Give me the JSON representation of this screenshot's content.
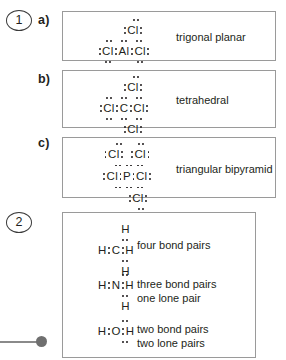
{
  "page": {
    "decoration": "page-marker-dot"
  },
  "questions": [
    {
      "number": "1",
      "parts": [
        {
          "label": "a)",
          "molecule": "AlCl3",
          "center_atom": "Al",
          "outer_atom": "Cl",
          "shape": "trigonal planar"
        },
        {
          "label": "b)",
          "molecule": "CCl4",
          "center_atom": "C",
          "outer_atom": "Cl",
          "shape": "tetrahedral"
        },
        {
          "label": "c)",
          "molecule": "PCl5",
          "center_atom": "P",
          "outer_atom": "Cl",
          "shape": "triangular bipyramid"
        }
      ]
    },
    {
      "number": "2",
      "parts": [
        {
          "molecule": "CH4",
          "center_atom": "C",
          "outer_atom": "H",
          "desc_line1": "four bond pairs",
          "desc_line2": ""
        },
        {
          "molecule": "NH3",
          "center_atom": "N",
          "outer_atom": "H",
          "desc_line1": "three bond pairs",
          "desc_line2": "one lone pair"
        },
        {
          "molecule": "H2O",
          "center_atom": "O",
          "outer_atom": "H",
          "desc_line1": "two bond pairs",
          "desc_line2": "two lone pairs"
        }
      ]
    }
  ],
  "atoms": {
    "Al": "Al",
    "C": "C",
    "P": "P",
    "N": "N",
    "O": "O",
    "Cl": "Cl",
    "H": "H"
  },
  "colors": {
    "ink": "#231f20",
    "box_border": "#9a9a9a",
    "marker": "#6f6f6f"
  }
}
